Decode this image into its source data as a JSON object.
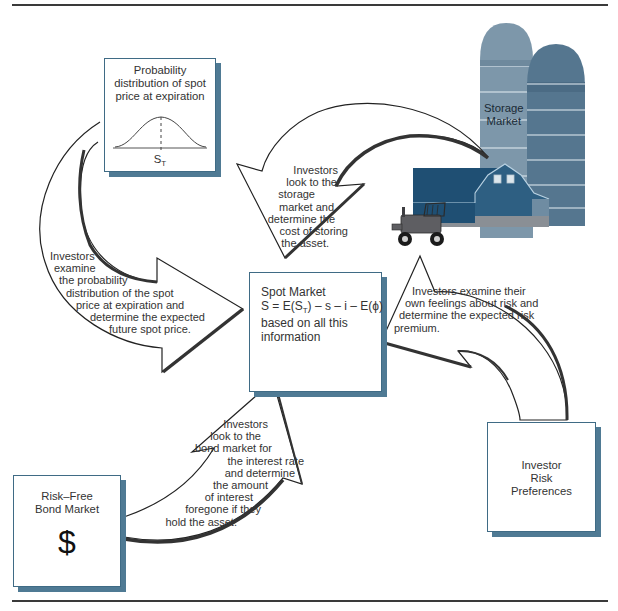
{
  "figure": {
    "type": "flow-diagram",
    "colors": {
      "box_border": "#3f6b85",
      "box_shadow": "#4f7a94",
      "silo_light": "#7d97aa",
      "silo_dark": "#55768f",
      "barn_dark": "#1f4f73",
      "barn_mid": "#2e5f82",
      "tractor": "#5e5e62",
      "arrow_outline": "#222222",
      "rule": "#3a3a3a"
    }
  },
  "nodes": {
    "probability_box": {
      "title_lines": [
        "Probability",
        "distribution of spot",
        "price at expiration"
      ],
      "axis_label": "S",
      "axis_subscript": "T"
    },
    "storage": {
      "label_lines": [
        "Storage",
        "Market"
      ]
    },
    "spot_market": {
      "title": "Spot Market",
      "formula": "S = E(Sₙ) – s – i – E(ϕ)",
      "formula_parts": {
        "lhs": "S = E(S",
        "sub": "T",
        "rhs": ") – s – i – E(ϕ)"
      },
      "desc_lines": [
        "based on all this",
        "information"
      ]
    },
    "bond_market": {
      "title_lines": [
        "Risk–Free",
        "Bond Market"
      ],
      "symbol": "$"
    },
    "risk_preferences": {
      "title_lines": [
        "Investor",
        "Risk",
        "Preferences"
      ]
    }
  },
  "arrows": {
    "probability_to_spot": {
      "lines": [
        "Investors",
        "examine",
        "the probability",
        "distribution of the spot",
        "price at expiration and",
        "determine the expected",
        "future spot price."
      ]
    },
    "storage_to_spot": {
      "lines": [
        "Investors",
        "look to the",
        "storage",
        "market and",
        "determine the",
        "cost of storing",
        "the asset."
      ]
    },
    "risk_to_spot": {
      "lines": [
        "Investors examine their",
        "own feelings about risk and",
        "determine the expected risk",
        "premium."
      ]
    },
    "bond_to_spot": {
      "lines": [
        "Investors",
        "look to the",
        "bond market for",
        "the interest rate",
        "and determine",
        "the amount",
        "of interest",
        "foregone if they",
        "hold the asset."
      ]
    }
  }
}
